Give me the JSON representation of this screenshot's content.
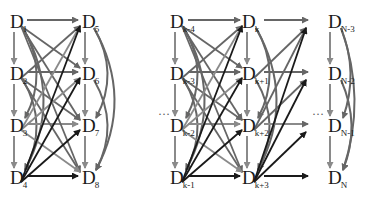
{
  "diagram": {
    "type": "dense-connection-graph",
    "colors": {
      "dark": "#1a1a1a",
      "mid": "#666666",
      "light": "#8a8a8a",
      "background": "#ffffff"
    },
    "ellipsis": "…",
    "columns": [
      {
        "id": "c1",
        "x": 17,
        "nodes": [
          {
            "base": "D",
            "sub": "1"
          },
          {
            "base": "D",
            "sub": "2"
          },
          {
            "base": "D",
            "sub": "3"
          },
          {
            "base": "D",
            "sub": "4"
          }
        ]
      },
      {
        "id": "c2",
        "x": 88,
        "nodes": [
          {
            "base": "D",
            "sub": "5"
          },
          {
            "base": "D",
            "sub": "6"
          },
          {
            "base": "D",
            "sub": "7"
          },
          {
            "base": "D",
            "sub": "8"
          }
        ]
      },
      {
        "id": "c3",
        "x": 178,
        "nodes": [
          {
            "base": "D",
            "sub": "k-4"
          },
          {
            "base": "D",
            "sub": "k-3"
          },
          {
            "base": "D",
            "sub": "k-2"
          },
          {
            "base": "D",
            "sub": "k-1"
          }
        ]
      },
      {
        "id": "c4",
        "x": 250,
        "nodes": [
          {
            "base": "D",
            "sub": "k"
          },
          {
            "base": "D",
            "sub": "k+1"
          },
          {
            "base": "D",
            "sub": "k+2"
          },
          {
            "base": "D",
            "sub": "k+3"
          }
        ]
      },
      {
        "id": "c5",
        "x": 333,
        "nodes": [
          {
            "base": "D",
            "sub": "N-3"
          },
          {
            "base": "D",
            "sub": "N-2"
          },
          {
            "base": "D",
            "sub": "N-1"
          },
          {
            "base": "D",
            "sub": "N"
          }
        ]
      }
    ],
    "rows_y": [
      22,
      74,
      126,
      178
    ]
  }
}
